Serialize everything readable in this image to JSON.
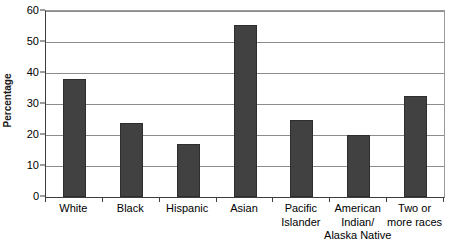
{
  "chart_data": {
    "type": "bar",
    "title": "",
    "subtitle": "",
    "xlabel": "",
    "ylabel": "Percentage",
    "ylim": [
      0,
      60
    ],
    "ytick_values": [
      0,
      10,
      20,
      30,
      40,
      50,
      60
    ],
    "ytick_labels": [
      "0",
      "10",
      "20",
      "30",
      "40",
      "50",
      "60"
    ],
    "grid": true,
    "legend": false,
    "categories": [
      "White",
      "Black",
      "Hispanic",
      "Asian",
      "Pacific Islander",
      "American Indian/ Alaska Native",
      "Two or more races"
    ],
    "category_lines": [
      [
        "White"
      ],
      [
        "Black"
      ],
      [
        "Hispanic"
      ],
      [
        "Asian"
      ],
      [
        "Pacific",
        "Islander"
      ],
      [
        "American",
        "Indian/",
        "Alaska Native"
      ],
      [
        "Two or",
        "more races"
      ]
    ],
    "values": [
      38,
      24,
      17,
      55.5,
      25,
      20,
      32.5
    ],
    "bar_color": "#414141",
    "axis_color": "#3d3d3d",
    "gridline_color": "#8c8c8c",
    "background_color": "#ffffff"
  }
}
